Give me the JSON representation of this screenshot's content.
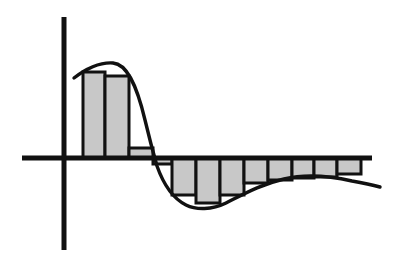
{
  "figure": {
    "title": "",
    "background_color": "#ffffff",
    "ink_color": "#111111",
    "bar_fill_color": "#c8c8c8",
    "bar_stroke_color": "#111111",
    "curve_color": "#111111",
    "axis_color": "#111111"
  },
  "chart_data": {
    "type": "bar",
    "title": "",
    "subtitle": "",
    "xlabel": "",
    "ylabel": "",
    "grid": false,
    "legend": null,
    "axes": {
      "origin_px": [
        64,
        158
      ],
      "x_axis_px": {
        "x1": 22,
        "y1": 158,
        "x2": 372,
        "y2": 158
      },
      "y_axis_px": {
        "x1": 64,
        "y1": 17,
        "x2": 64,
        "y2": 250
      },
      "xlim": [
        -1.2,
        11.0
      ],
      "ylim": [
        -1.0,
        1.5
      ],
      "x_ticks": [],
      "y_ticks": []
    },
    "categories": [
      "0",
      "1",
      "2",
      "3",
      "4",
      "5",
      "6",
      "7",
      "8",
      "9",
      "10",
      "11"
    ],
    "values": [
      0.92,
      0.86,
      0.1,
      -0.06,
      -0.38,
      -0.48,
      -0.38,
      -0.26,
      -0.22,
      -0.2,
      -0.18,
      -0.14
    ],
    "bars_px": [
      {
        "index": 0,
        "x": 83,
        "width": 22,
        "top": 72,
        "bottom": 158,
        "sign": "positive"
      },
      {
        "index": 1,
        "x": 105,
        "width": 24,
        "top": 76,
        "bottom": 158,
        "sign": "positive"
      },
      {
        "index": 2,
        "x": 129,
        "width": 24,
        "top": 148,
        "bottom": 158,
        "sign": "positive"
      },
      {
        "index": 3,
        "x": 153,
        "width": 19,
        "top": 158,
        "bottom": 164,
        "sign": "negative"
      },
      {
        "index": 4,
        "x": 172,
        "width": 24,
        "top": 158,
        "bottom": 195,
        "sign": "negative"
      },
      {
        "index": 5,
        "x": 196,
        "width": 24,
        "top": 158,
        "bottom": 203,
        "sign": "negative"
      },
      {
        "index": 6,
        "x": 220,
        "width": 24,
        "top": 158,
        "bottom": 195,
        "sign": "negative"
      },
      {
        "index": 7,
        "x": 244,
        "width": 24,
        "top": 158,
        "bottom": 183,
        "sign": "negative"
      },
      {
        "index": 8,
        "x": 268,
        "width": 24,
        "top": 158,
        "bottom": 180,
        "sign": "negative"
      },
      {
        "index": 9,
        "x": 292,
        "width": 22,
        "top": 158,
        "bottom": 178,
        "sign": "negative"
      },
      {
        "index": 10,
        "x": 314,
        "width": 23,
        "top": 158,
        "bottom": 177,
        "sign": "negative"
      },
      {
        "index": 11,
        "x": 337,
        "width": 24,
        "top": 158,
        "bottom": 174,
        "sign": "negative"
      }
    ],
    "curve": {
      "name": "damped-oscillation",
      "start_px": [
        74,
        78
      ],
      "peak_px": [
        113,
        63
      ],
      "zero_crossing_px": [
        152,
        158
      ],
      "trough_px": [
        205,
        208
      ],
      "second_zero_region_px": [
        300,
        176
      ],
      "end_px": [
        380,
        186
      ],
      "path_d": "M 74 78 C 85 69, 100 62, 113 63 C 126 64, 136 82, 145 120 C 150 141, 153 152, 157 166 C 163 183, 172 198, 186 205 C 196 210, 212 210, 226 203 C 244 194, 262 184, 284 179 C 305 174, 330 176, 352 181 C 364 183, 373 185, 380 187"
    }
  },
  "elements": {
    "x_axis_name": "x-axis",
    "y_axis_name": "y-axis",
    "curve_name": "damped-oscillation-curve",
    "bars_group_name": "histogram-bars"
  }
}
